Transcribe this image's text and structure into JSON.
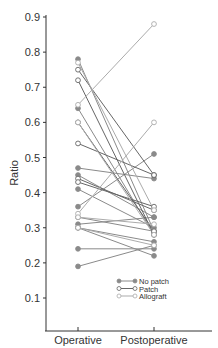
{
  "chart_data": {
    "type": "line",
    "title": "",
    "xlabel": "",
    "ylabel": "Ratio",
    "categories": [
      "Operative",
      "Postoperative"
    ],
    "ylim": [
      0.0,
      0.9
    ],
    "yticks": [
      0.1,
      0.2,
      0.3,
      0.4,
      0.5,
      0.6,
      0.7,
      0.8,
      0.9
    ],
    "ytick_labels": [
      "0.1",
      "0.2",
      "0.3",
      "0.4",
      "0.5",
      "0.6",
      "0.7",
      "0.8",
      "0.9"
    ],
    "grid": false,
    "legend_position": "bottom-right",
    "legend": [
      {
        "name": "No patch",
        "marker": "filled",
        "color": "#888888"
      },
      {
        "name": "Patch",
        "marker": "open",
        "color": "#666666"
      },
      {
        "name": "Allograft",
        "marker": "open",
        "color": "#aaaaaa"
      }
    ],
    "series": [
      {
        "group": "No patch",
        "values": [
          0.78,
          0.29
        ]
      },
      {
        "group": "No patch",
        "values": [
          0.64,
          0.28
        ]
      },
      {
        "group": "No patch",
        "values": [
          0.47,
          0.44
        ]
      },
      {
        "group": "No patch",
        "values": [
          0.45,
          0.33
        ]
      },
      {
        "group": "No patch",
        "values": [
          0.41,
          0.3
        ]
      },
      {
        "group": "No patch",
        "values": [
          0.36,
          0.51
        ]
      },
      {
        "group": "No patch",
        "values": [
          0.33,
          0.29
        ]
      },
      {
        "group": "No patch",
        "values": [
          0.31,
          0.33
        ]
      },
      {
        "group": "No patch",
        "values": [
          0.3,
          0.22
        ]
      },
      {
        "group": "No patch",
        "values": [
          0.3,
          0.26
        ]
      },
      {
        "group": "No patch",
        "values": [
          0.24,
          0.24
        ]
      },
      {
        "group": "No patch",
        "values": [
          0.19,
          0.25
        ]
      },
      {
        "group": "Patch",
        "values": [
          0.75,
          0.45
        ]
      },
      {
        "group": "Patch",
        "values": [
          0.72,
          0.28
        ]
      },
      {
        "group": "Patch",
        "values": [
          0.6,
          0.29
        ]
      },
      {
        "group": "Patch",
        "values": [
          0.54,
          0.45
        ]
      },
      {
        "group": "Patch",
        "values": [
          0.44,
          0.35
        ]
      },
      {
        "group": "Patch",
        "values": [
          0.43,
          0.36
        ]
      },
      {
        "group": "Allograft",
        "values": [
          0.65,
          0.88
        ]
      },
      {
        "group": "Allograft",
        "values": [
          0.6,
          0.28
        ]
      },
      {
        "group": "Allograft",
        "values": [
          0.34,
          0.6
        ]
      },
      {
        "group": "Allograft",
        "values": [
          0.33,
          0.31
        ]
      },
      {
        "group": "Allograft",
        "values": [
          0.77,
          0.35
        ]
      },
      {
        "group": "Allograft",
        "values": [
          0.3,
          0.25
        ]
      }
    ]
  }
}
